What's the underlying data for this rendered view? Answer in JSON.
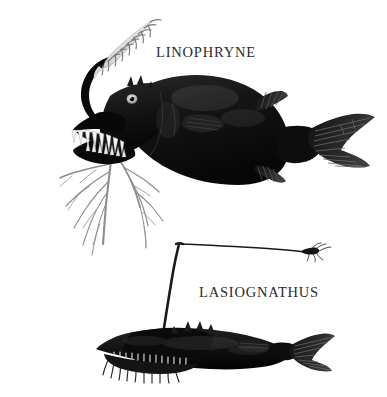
{
  "plate": {
    "kind": "natural-history-illustration",
    "background_color": "#ffffff",
    "ink_color": "#111111",
    "width": 387,
    "height": 397
  },
  "labels": {
    "linophryne": "LINOPHRYNE",
    "lasiognathus": "LASIOGNATHUS"
  },
  "specimens": [
    {
      "name": "LINOPHRYNE",
      "position": "upper",
      "description": "Deep-sea anglerfish with feathery luminous esca on a curved illicium, gaping jaws with long fang-like teeth, and a branching root-like hyoid barbel",
      "features": [
        "esca-filaments",
        "illicium-stalk",
        "gaping-jaw",
        "fang-teeth",
        "eye",
        "branching-barbel",
        "pectoral-fin",
        "dorsal-fin",
        "anal-fin",
        "caudal-fin"
      ]
    },
    {
      "name": "LASIOGNATHUS",
      "position": "lower",
      "description": "Elongated black deep-sea anglerfish with a long bent fishing-rod illicium ending in a small hooked bait, and pale rib-like striations along the belly",
      "features": [
        "fishing-rod-illicium",
        "hooked-bait",
        "elongated-body",
        "belly-striations",
        "caudal-fin",
        "pectoral-fin"
      ]
    }
  ]
}
